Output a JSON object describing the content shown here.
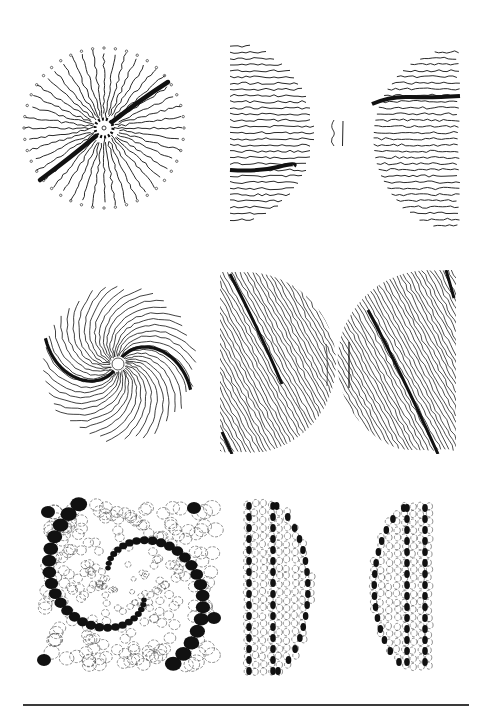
{
  "figure": {
    "background": "#ffffff",
    "ink": "#111111",
    "rows": [
      {
        "pattern": "radial-stripes",
        "panels": [
          {
            "name": "radial-stripe-disc",
            "shape": "circle",
            "x": 20,
            "y": 40,
            "w": 168,
            "h": 178
          },
          {
            "name": "horizontal-stripes-left-half",
            "shape": "d-right",
            "x": 228,
            "y": 42,
            "w": 92,
            "h": 182
          },
          {
            "name": "horizontal-stripes-right-half",
            "shape": "d-left",
            "x": 360,
            "y": 48,
            "w": 102,
            "h": 182
          }
        ]
      },
      {
        "pattern": "spiral-stripes",
        "panels": [
          {
            "name": "spiral-stripe-disc",
            "shape": "circle",
            "x": 36,
            "y": 272,
            "w": 164,
            "h": 180
          },
          {
            "name": "oblique-stripes-left-half",
            "shape": "d-right",
            "x": 220,
            "y": 272,
            "w": 100,
            "h": 182
          },
          {
            "name": "oblique-stripes-right-half",
            "shape": "d-left",
            "x": 350,
            "y": 270,
            "w": 106,
            "h": 184
          }
        ]
      },
      {
        "pattern": "spiral-spots",
        "panels": [
          {
            "name": "spiral-spot-square",
            "shape": "square",
            "x": 38,
            "y": 500,
            "w": 182,
            "h": 170
          },
          {
            "name": "spot-rows-left-half",
            "shape": "d-right",
            "x": 243,
            "y": 500,
            "w": 96,
            "h": 178
          },
          {
            "name": "spot-rows-right-half",
            "shape": "d-left",
            "x": 345,
            "y": 502,
            "w": 92,
            "h": 170
          }
        ]
      }
    ],
    "bottom_rule": {
      "x1": 23,
      "x2": 469,
      "y": 705
    }
  }
}
